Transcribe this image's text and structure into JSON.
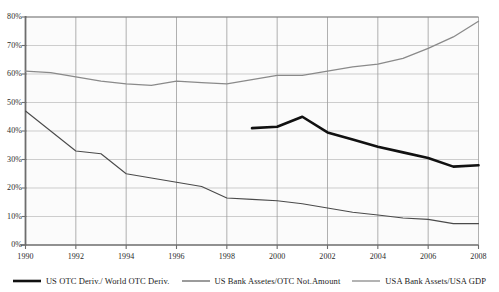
{
  "chart_data": {
    "type": "line",
    "title": "",
    "xlabel": "",
    "ylabel": "",
    "xlim": [
      1990,
      2008
    ],
    "ylim": [
      0,
      80
    ],
    "grid": true,
    "legend_position": "bottom",
    "y_ticks": [
      "0%",
      "10%",
      "20%",
      "30%",
      "40%",
      "50%",
      "60%",
      "70%",
      "80%"
    ],
    "y_tick_values": [
      0,
      10,
      20,
      30,
      40,
      50,
      60,
      70,
      80
    ],
    "x_ticks": [
      "1990",
      "1992",
      "1994",
      "1996",
      "1998",
      "2000",
      "2002",
      "2004",
      "2006",
      "2008"
    ],
    "x_tick_values": [
      1990,
      1992,
      1994,
      1996,
      1998,
      2000,
      2002,
      2004,
      2006,
      2008
    ],
    "series": [
      {
        "name": "US OTC Deriv./ World OTC Deriv.",
        "color": "#111111",
        "width": 2.6,
        "x": [
          1999,
          2000,
          2001,
          2002,
          2003,
          2004,
          2005,
          2006,
          2007,
          2008
        ],
        "values": [
          41,
          41.5,
          45,
          39.5,
          37,
          34.5,
          32.5,
          30.5,
          27.5,
          28
        ]
      },
      {
        "name": "US Bank Assetes/OTC Not.Amount",
        "color": "#4a4a4a",
        "width": 1.1,
        "x": [
          1990,
          1991,
          1992,
          1993,
          1994,
          1995,
          1996,
          1997,
          1998,
          1999,
          2000,
          2001,
          2002,
          2003,
          2004,
          2005,
          2006,
          2007,
          2008
        ],
        "values": [
          47,
          40,
          33,
          32,
          25,
          23.5,
          22,
          20.5,
          16.5,
          16,
          15.5,
          14.5,
          13,
          11.5,
          10.5,
          9.5,
          9,
          7.5,
          7.5
        ]
      },
      {
        "name": "USA Bank Assets/USA GDP",
        "color": "#8a8a8a",
        "width": 1.3,
        "x": [
          1990,
          1991,
          1992,
          1993,
          1994,
          1995,
          1996,
          1997,
          1998,
          1999,
          2000,
          2001,
          2002,
          2003,
          2004,
          2005,
          2006,
          2007,
          2008
        ],
        "values": [
          61,
          60.5,
          59,
          57.5,
          56.5,
          56,
          57.5,
          57,
          56.5,
          58,
          59.5,
          59.5,
          61,
          62.5,
          63.5,
          65.5,
          69,
          73,
          78.5
        ]
      }
    ]
  },
  "legend": {
    "items": [
      {
        "label": "US OTC Deriv./ World OTC Deriv."
      },
      {
        "label": "US Bank Assetes/OTC Not.Amount"
      },
      {
        "label": "USA Bank Assets/USA GDP"
      }
    ]
  }
}
